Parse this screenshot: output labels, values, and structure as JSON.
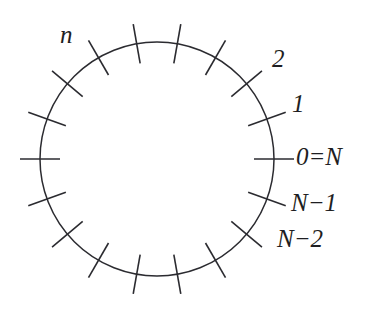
{
  "figure": {
    "name": "discrete-time-circle",
    "geometry": {
      "center_x": 157,
      "center_y": 159,
      "radius": 117,
      "tick_count": 18,
      "tick_spacing_degrees": 20,
      "tick_inner_extent": 20,
      "tick_outer_extent": 20
    },
    "colors": {
      "stroke": "#2b2b30",
      "text": "#1e1e22",
      "background": "#ffffff"
    },
    "labels": [
      {
        "id": "n",
        "text": "n",
        "angle_degrees": 150
      },
      {
        "id": "two",
        "text": "2",
        "angle_degrees": 40
      },
      {
        "id": "one",
        "text": "1",
        "angle_degrees": 20
      },
      {
        "id": "zeroN",
        "text": "0=N",
        "angle_degrees": 0
      },
      {
        "id": "Nm1",
        "text": "N−1",
        "angle_degrees": -20
      },
      {
        "id": "Nm2",
        "text": "N−2",
        "angle_degrees": -40
      }
    ]
  },
  "chart_data": {
    "type": "scatter",
    "title": "",
    "xlabel": "",
    "ylabel": "",
    "categories": [
      "0=N",
      "1",
      "2",
      "n",
      "N−2",
      "N−1"
    ],
    "values": [
      0,
      1,
      2,
      null,
      null,
      null
    ],
    "annotations": [
      "n",
      "2",
      "1",
      "0=N",
      "N−1",
      "N−2"
    ]
  }
}
